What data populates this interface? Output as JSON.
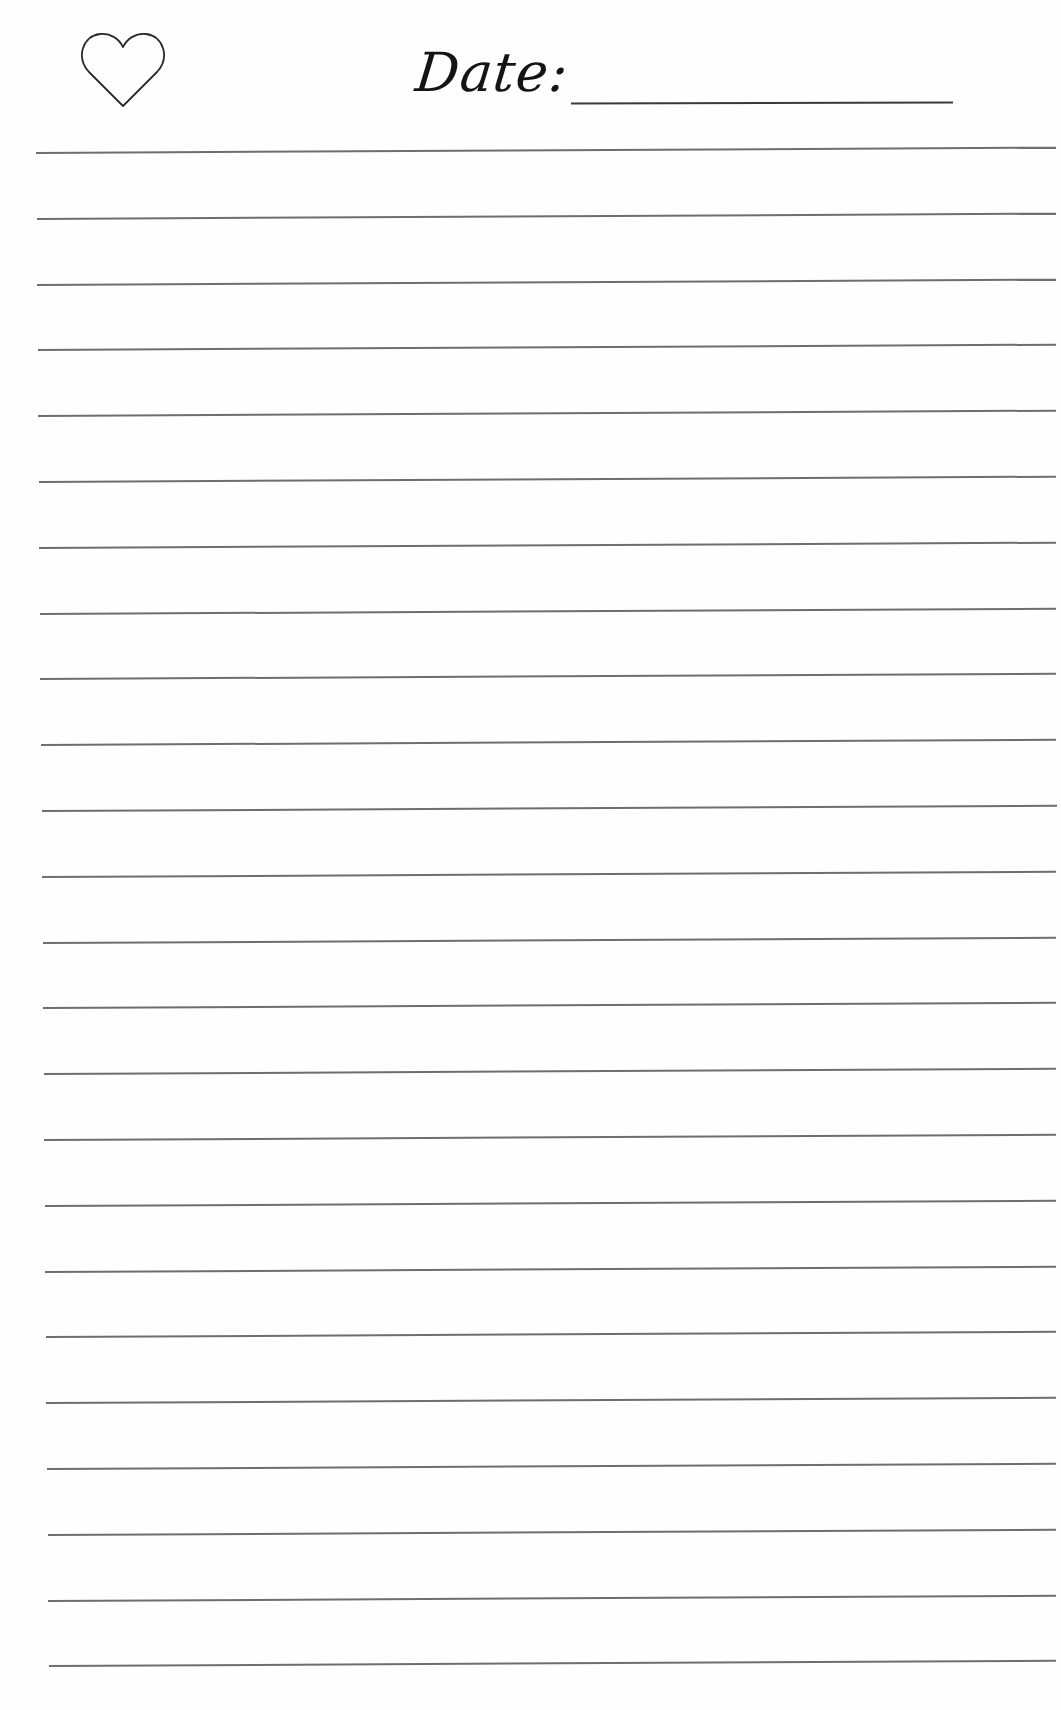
{
  "header": {
    "icon": "heart-outline-icon",
    "date_label": "Date:",
    "date_value": ""
  },
  "page": {
    "background": "#fefefe",
    "line_color": "#6e6e6e",
    "ruled_line_count": 24
  }
}
